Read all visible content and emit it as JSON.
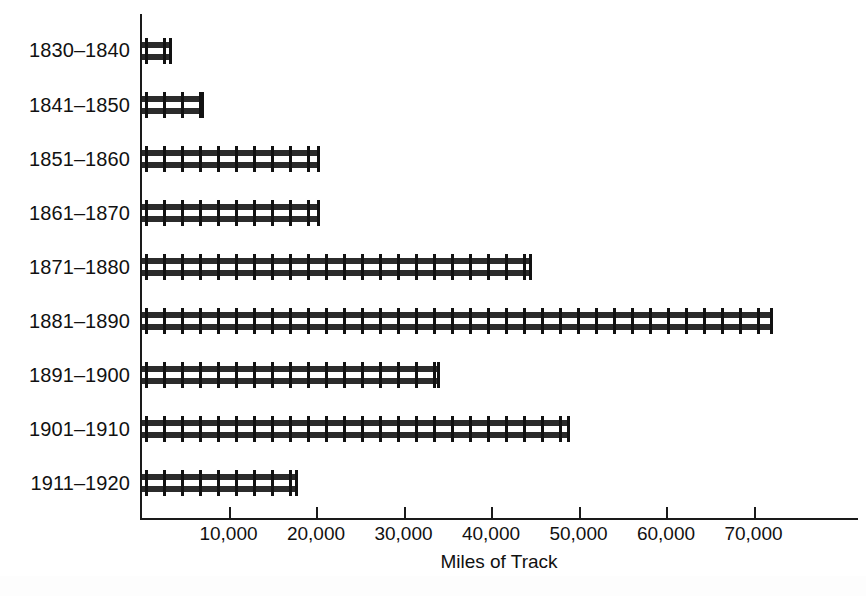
{
  "chart_data": {
    "type": "bar",
    "orientation": "horizontal",
    "title": "",
    "subtitle": "",
    "xlabel": "Miles of Track",
    "ylabel": "",
    "categories": [
      "1830–1840",
      "1841–1850",
      "1851–1860",
      "1861–1870",
      "1871–1880",
      "1881–1890",
      "1891–1900",
      "1901–1910",
      "1911–1920"
    ],
    "values": [
      3500,
      7200,
      20500,
      20500,
      44700,
      72200,
      34200,
      49000,
      17900
    ],
    "xlim": [
      0,
      82000
    ],
    "ylim": null,
    "xticks": [
      10000,
      20000,
      30000,
      40000,
      50000,
      60000,
      70000
    ],
    "xtick_labels": [
      "10,000",
      "20,000",
      "30,000",
      "40,000",
      "50,000",
      "60,000",
      "70,000"
    ],
    "grid": false,
    "legend": null,
    "bar_style": "railroad-track",
    "colors": {
      "bar": "#2b2b2b",
      "tie": "#121212",
      "axis": "#1a1a1a",
      "text": "#111111",
      "background": "#ffffff"
    },
    "annotations": []
  },
  "axis": {
    "x_title": "Miles of Track"
  }
}
